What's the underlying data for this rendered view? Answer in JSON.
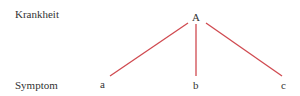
{
  "diagram": {
    "row_labels": {
      "top": "Krankheit",
      "bottom": "Symptom"
    },
    "root": {
      "label": "A"
    },
    "children": [
      {
        "label": "a"
      },
      {
        "label": "b"
      },
      {
        "label": "c"
      }
    ],
    "edge_color": "#d04a50"
  }
}
